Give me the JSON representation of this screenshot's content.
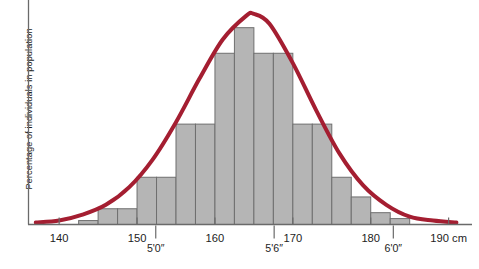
{
  "chart_data": {
    "type": "bar",
    "title": "",
    "subtitle": "",
    "xlabel": "",
    "ylabel": "Percentage of individuals in population",
    "xlim": [
      136,
      193
    ],
    "ylim": [
      0,
      100
    ],
    "grid": false,
    "legend": null,
    "axis_unit_label": "190 cm",
    "x_tick_labels": [
      "140",
      "150",
      "160",
      "170",
      "180",
      "190 cm"
    ],
    "x_tick_values": [
      140,
      150,
      160,
      170,
      180,
      190
    ],
    "secondary_x_tick_labels": [
      "5'0″",
      "5'6″",
      "6'0″"
    ],
    "secondary_x_tick_values": [
      152.4,
      167.6,
      182.9
    ],
    "bin_edges": [
      142.5,
      145,
      147.5,
      150,
      152.5,
      155,
      157.5,
      160,
      162.5,
      165,
      167.5,
      170,
      172.5,
      175,
      177.5,
      180,
      182.5,
      185
    ],
    "categories": [
      "142.5-145",
      "145-147.5",
      "147.5-150",
      "150-152.5",
      "152.5-155",
      "155-157.5",
      "157.5-160",
      "160-162.5",
      "162.5-165",
      "165-167.5",
      "167.5-170",
      "170-172.5",
      "172.5-175",
      "175-177.5",
      "177.5-180",
      "180-182.5",
      "182.5-185"
    ],
    "values": [
      2,
      8,
      8,
      24,
      24,
      51,
      51,
      87,
      100,
      87,
      87,
      51,
      51,
      24,
      14,
      6,
      3
    ],
    "series": [
      {
        "name": "Height distribution (histogram)",
        "type": "bar",
        "values": [
          2,
          8,
          8,
          24,
          24,
          51,
          51,
          87,
          100,
          87,
          87,
          51,
          51,
          24,
          14,
          6,
          3
        ],
        "fill_color": "#b5b5b5",
        "edge_color": "#6f6f6f"
      },
      {
        "name": "Normal distribution curve",
        "type": "line",
        "color": "#a41e31",
        "line_width": 4,
        "mean": 165,
        "peak_value": 107,
        "points_x": [
          137,
          140,
          143,
          146,
          149,
          152,
          155,
          158,
          161,
          164,
          165,
          167,
          170,
          173,
          176,
          179,
          182,
          185,
          188,
          191
        ],
        "points_y": [
          1,
          2,
          5,
          10,
          19,
          33,
          52,
          74,
          94,
          106,
          107,
          102,
          82,
          58,
          36,
          20,
          10,
          4,
          2,
          1
        ]
      }
    ],
    "colors": {
      "bar_fill": "#b5b5b5",
      "bar_edge": "#6f6f6f",
      "curve": "#a41e31",
      "axis": "#6a6a6a",
      "text": "#1d1d1d",
      "background": "#ffffff"
    }
  }
}
